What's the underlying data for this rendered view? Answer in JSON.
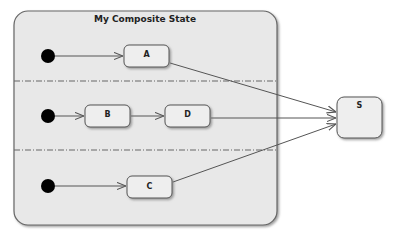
{
  "composite": {
    "title": "My Composite State",
    "regions": 3
  },
  "states": {
    "a": "A",
    "b": "B",
    "c": "C",
    "d": "D",
    "s": "S"
  },
  "transitions": [
    {
      "from": "initial-1",
      "to": "A"
    },
    {
      "from": "initial-2",
      "to": "B"
    },
    {
      "from": "B",
      "to": "D"
    },
    {
      "from": "initial-3",
      "to": "C"
    },
    {
      "from": "A",
      "to": "S"
    },
    {
      "from": "D",
      "to": "S"
    },
    {
      "from": "C",
      "to": "S"
    }
  ],
  "colors": {
    "composite_fill": "#e8e8e8",
    "state_fill": "#eeeeee",
    "stroke": "#555555",
    "initial": "#000000"
  }
}
